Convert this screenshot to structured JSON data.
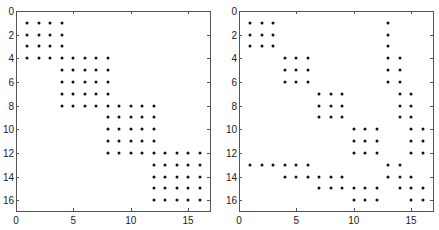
{
  "chart_data": [
    {
      "type": "scatter",
      "subtype": "sparsity-pattern (spy plot)",
      "title": "",
      "xlabel": "",
      "ylabel": "",
      "xlim": [
        0,
        17
      ],
      "ylim": [
        17,
        0
      ],
      "xticks": [
        0,
        5,
        10,
        15
      ],
      "yticks": [
        0,
        2,
        4,
        6,
        8,
        10,
        12,
        14,
        16
      ],
      "grid": false,
      "y_reversed": true,
      "marker_color": "#111111",
      "rows": {
        "1": [
          1,
          2,
          3,
          4
        ],
        "2": [
          1,
          2,
          3,
          4
        ],
        "3": [
          1,
          2,
          3,
          4
        ],
        "4": [
          1,
          2,
          3,
          4,
          5,
          6,
          7,
          8
        ],
        "5": [
          4,
          5,
          6,
          7,
          8
        ],
        "6": [
          4,
          5,
          6,
          7,
          8
        ],
        "7": [
          4,
          5,
          6,
          7,
          8
        ],
        "8": [
          4,
          5,
          6,
          7,
          8,
          9,
          10,
          11,
          12
        ],
        "9": [
          8,
          9,
          10,
          11,
          12
        ],
        "10": [
          8,
          9,
          10,
          11,
          12
        ],
        "11": [
          8,
          9,
          10,
          11,
          12
        ],
        "12": [
          8,
          9,
          10,
          11,
          12,
          13,
          14,
          15,
          16
        ],
        "13": [
          12,
          13,
          14,
          15,
          16
        ],
        "14": [
          12,
          13,
          14,
          15,
          16
        ],
        "15": [
          12,
          13,
          14,
          15,
          16
        ],
        "16": [
          12,
          13,
          14,
          15,
          16
        ]
      }
    },
    {
      "type": "scatter",
      "subtype": "sparsity-pattern (spy plot)",
      "title": "",
      "xlabel": "",
      "ylabel": "",
      "xlim": [
        0,
        17
      ],
      "ylim": [
        17,
        0
      ],
      "xticks": [
        0,
        5,
        10,
        15
      ],
      "yticks": [
        0,
        2,
        4,
        6,
        8,
        10,
        12,
        14,
        16
      ],
      "grid": false,
      "y_reversed": true,
      "marker_color": "#111111",
      "rows": {
        "1": [
          1,
          2,
          3,
          13
        ],
        "2": [
          1,
          2,
          3,
          13
        ],
        "3": [
          1,
          2,
          3,
          13
        ],
        "4": [
          4,
          5,
          6,
          13,
          14
        ],
        "5": [
          4,
          5,
          6,
          13,
          14
        ],
        "6": [
          4,
          5,
          6,
          13,
          14
        ],
        "7": [
          7,
          8,
          9,
          14,
          15
        ],
        "8": [
          7,
          8,
          9,
          14,
          15
        ],
        "9": [
          7,
          8,
          9,
          14,
          15
        ],
        "10": [
          10,
          11,
          12,
          15,
          16
        ],
        "11": [
          10,
          11,
          12,
          15,
          16
        ],
        "12": [
          10,
          11,
          12,
          15,
          16
        ],
        "13": [
          1,
          2,
          3,
          4,
          5,
          6,
          13,
          14
        ],
        "14": [
          4,
          5,
          6,
          7,
          8,
          9,
          13,
          14,
          15
        ],
        "15": [
          7,
          8,
          9,
          10,
          11,
          12,
          14,
          15,
          16
        ],
        "16": [
          10,
          11,
          12,
          15,
          16
        ]
      }
    }
  ],
  "layout": {
    "axes": [
      {
        "left": 16,
        "top": 11,
        "width": 195,
        "height": 201
      },
      {
        "left": 239,
        "top": 11,
        "width": 195,
        "height": 201
      }
    ]
  }
}
